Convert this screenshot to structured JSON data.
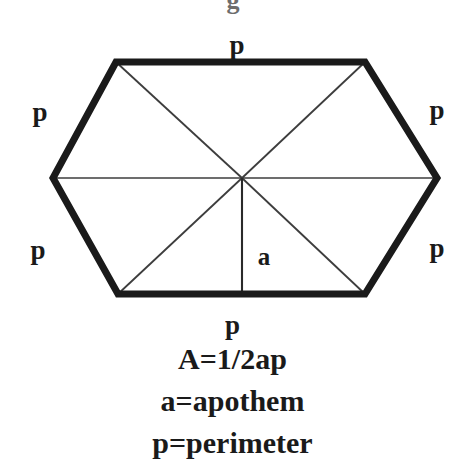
{
  "figure": {
    "title_partial": "g",
    "shape": "hexagon",
    "stroke_color": "#1a1a1a",
    "thin_stroke_color": "#3d3d3d",
    "background": "#ffffff",
    "outer_stroke_width": 7,
    "inner_stroke_width": 1.6,
    "vertices": [
      {
        "name": "top-left",
        "x": 116,
        "y": 62
      },
      {
        "name": "top-right",
        "x": 365,
        "y": 62
      },
      {
        "name": "right",
        "x": 437,
        "y": 178
      },
      {
        "name": "bottom-right",
        "x": 365,
        "y": 294
      },
      {
        "name": "bottom-left",
        "x": 118,
        "y": 294
      },
      {
        "name": "left",
        "x": 53,
        "y": 178
      }
    ],
    "center": {
      "x": 242,
      "y": 178
    },
    "side_labels": [
      {
        "name": "top",
        "text": "p",
        "x": 237,
        "y": 45
      },
      {
        "name": "upper-left",
        "text": "p",
        "x": 40,
        "y": 112
      },
      {
        "name": "lower-left",
        "text": "p",
        "x": 38,
        "y": 250
      },
      {
        "name": "upper-right",
        "text": "p",
        "x": 437,
        "y": 110
      },
      {
        "name": "lower-right",
        "text": "p",
        "x": 437,
        "y": 248
      }
    ],
    "apothem_label": {
      "text": "a",
      "x": 264,
      "y": 256
    },
    "apothem_line": {
      "x1": 242,
      "y1": 178,
      "x2": 242,
      "y2": 294
    }
  },
  "caption": {
    "bottom_side_label": "p",
    "area_formula": "A=1/2ap",
    "apothem_definition": "a=apothem",
    "perimeter_definition": "p=perimeter"
  }
}
